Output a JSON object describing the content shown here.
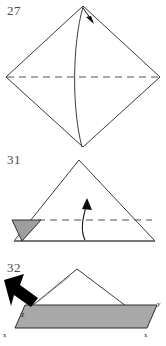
{
  "page": {
    "kind": "origami-instruction-diagram",
    "width": 166,
    "height": 346,
    "background_color": "#ffffff"
  },
  "palette": {
    "line_color": "#3a3a3a",
    "dashed_line_color": "#555555",
    "shaded_fill": "#9e9e9e",
    "shaded_fill_light": "#a8a8a8",
    "arrow_solid_color": "#000000",
    "number_color": "#4a4a4a",
    "label_color": "#1a1a1a"
  },
  "steps": [
    {
      "id": "step-27",
      "number": "27",
      "shape": "diamond",
      "description": "Square rotated 45 degrees with horizontal dashed crease line and a curved valley fold from top vertex to bottom vertex",
      "annotations": {
        "dashed_crease": "horizontal",
        "fold_arrow": "short-arrow-down-right-at-top-vertex",
        "curve": "vertical-curved-fold-line"
      }
    },
    {
      "id": "step-31",
      "number": "31",
      "shape": "triangle",
      "description": "Wide triangle with a small shaded triangular flap at the lower-left, a horizontal dashed crease and a curved arrow folding upward",
      "annotations": {
        "dashed_crease": "horizontal",
        "fold_arrow": "curved-arrow-up",
        "shaded_flap": "lower-left"
      }
    },
    {
      "id": "step-32",
      "number": "32",
      "shape": "triangle-on-shaded-band",
      "description": "Triangle sitting on a shaded parallelogram band with a bold solid arrow pressing into the left corner",
      "annotations": {
        "push_arrow": "bold-solid-arrow-down-right",
        "shaded_band": "parallelogram"
      },
      "labels": [
        {
          "name": "corner-label-z",
          "text": "z",
          "position": "band-left-inside"
        },
        {
          "name": "corner-label-x-left",
          "text": "x",
          "position": "band-bottom-left"
        },
        {
          "name": "corner-label-x-right",
          "text": "x",
          "position": "band-bottom-right"
        },
        {
          "name": "corner-label-y-right",
          "text": "y",
          "position": "band-top-right"
        }
      ]
    }
  ]
}
